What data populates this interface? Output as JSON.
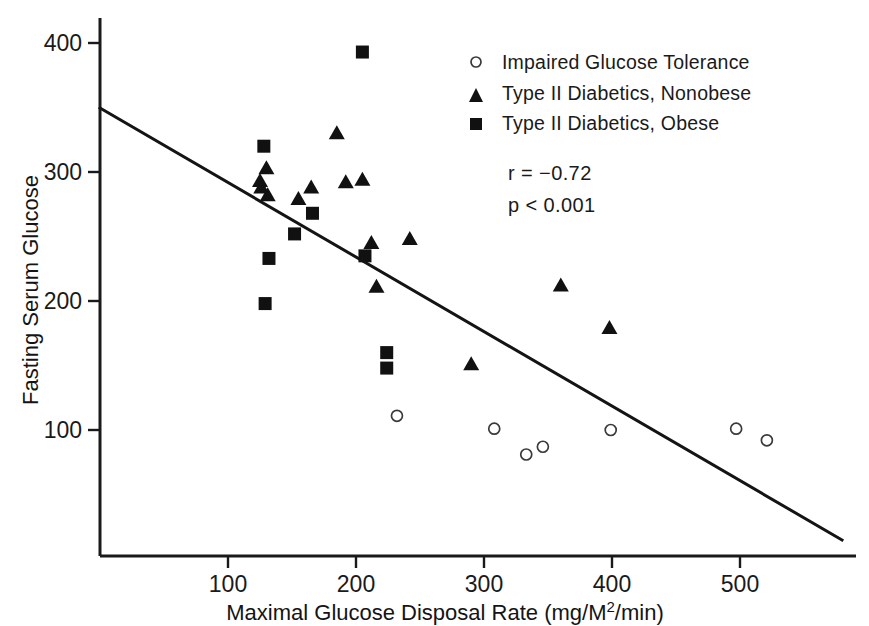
{
  "chart_data": {
    "type": "scatter",
    "title": "",
    "xlabel": "Maximal Glucose Disposal Rate (mg/M2/min)",
    "xlabel_parts": {
      "pre": "Maximal Glucose Disposal Rate (mg/M",
      "sup": "2",
      "post": "/min)"
    },
    "ylabel": "Fasting Serum Glucose",
    "xlim": [
      0,
      590
    ],
    "ylim": [
      0,
      420
    ],
    "xticks": [
      100,
      200,
      300,
      400,
      500
    ],
    "yticks": [
      100,
      200,
      300,
      400
    ],
    "grid": false,
    "legend_position": "top-right",
    "annotations": [
      "r = −0.72",
      "p < 0.001"
    ],
    "stats": {
      "r_label": "r = −0.72",
      "p_label": "p < 0.001",
      "r_value": -0.72,
      "p_value": "<0.001"
    },
    "series": [
      {
        "name": "Impaired Glucose Tolerance",
        "marker": "open-circle",
        "color": "#3a3a3a",
        "points": [
          {
            "x": 232,
            "y": 111
          },
          {
            "x": 308,
            "y": 101
          },
          {
            "x": 333,
            "y": 81
          },
          {
            "x": 346,
            "y": 87
          },
          {
            "x": 399,
            "y": 100
          },
          {
            "x": 497,
            "y": 101
          },
          {
            "x": 521,
            "y": 92
          }
        ]
      },
      {
        "name": "Type II Diabetics, Nonobese",
        "marker": "filled-triangle",
        "color": "#111111",
        "points": [
          {
            "x": 125,
            "y": 293
          },
          {
            "x": 126,
            "y": 288
          },
          {
            "x": 130,
            "y": 303
          },
          {
            "x": 131,
            "y": 282
          },
          {
            "x": 155,
            "y": 279
          },
          {
            "x": 165,
            "y": 288
          },
          {
            "x": 185,
            "y": 330
          },
          {
            "x": 192,
            "y": 292
          },
          {
            "x": 205,
            "y": 294
          },
          {
            "x": 212,
            "y": 245
          },
          {
            "x": 216,
            "y": 211
          },
          {
            "x": 242,
            "y": 248
          },
          {
            "x": 290,
            "y": 151
          },
          {
            "x": 360,
            "y": 212
          },
          {
            "x": 398,
            "y": 179
          }
        ]
      },
      {
        "name": "Type II Diabetics, Obese",
        "marker": "filled-square",
        "color": "#111111",
        "points": [
          {
            "x": 128,
            "y": 320
          },
          {
            "x": 132,
            "y": 233
          },
          {
            "x": 129,
            "y": 198
          },
          {
            "x": 152,
            "y": 252
          },
          {
            "x": 166,
            "y": 268
          },
          {
            "x": 205,
            "y": 393
          },
          {
            "x": 207,
            "y": 235
          },
          {
            "x": 224,
            "y": 160
          },
          {
            "x": 224,
            "y": 148
          }
        ]
      }
    ],
    "regression_line": {
      "x0": 0,
      "y0": 350,
      "x1": 590,
      "y1": 20
    }
  },
  "legend": {
    "items": [
      {
        "marker": "open-circle",
        "label": "Impaired Glucose Tolerance"
      },
      {
        "marker": "filled-triangle",
        "label": "Type II Diabetics, Nonobese"
      },
      {
        "marker": "filled-square",
        "label": "Type II Diabetics, Obese"
      }
    ]
  },
  "ticklabels": {
    "x": [
      "100",
      "200",
      "300",
      "400",
      "500"
    ],
    "y": [
      "400",
      "300",
      "200",
      "100"
    ]
  }
}
